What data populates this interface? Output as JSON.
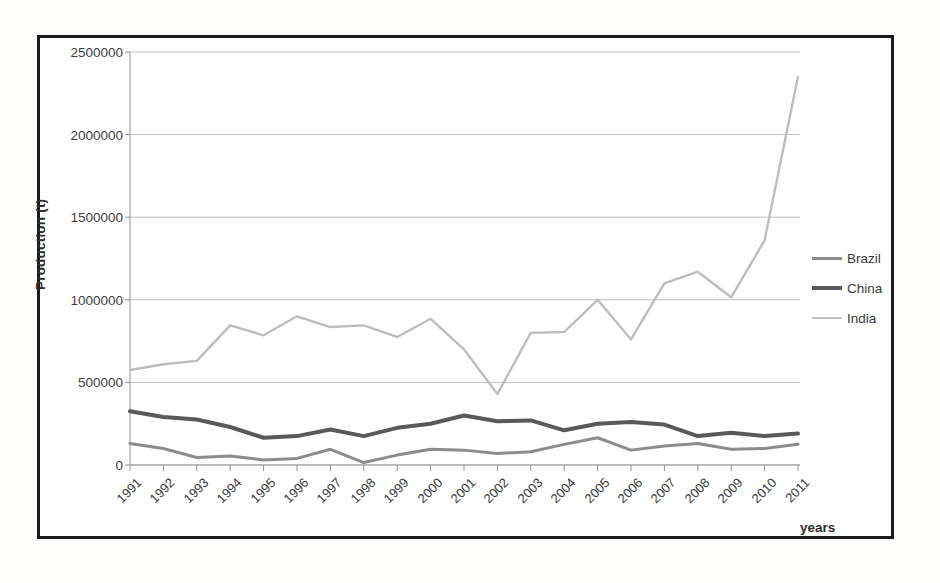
{
  "chart_data": {
    "type": "line",
    "title": "",
    "xlabel": "years",
    "ylabel": "Production (t)",
    "x": [
      1991,
      1992,
      1993,
      1994,
      1995,
      1996,
      1997,
      1998,
      1999,
      2000,
      2001,
      2002,
      2003,
      2004,
      2005,
      2006,
      2007,
      2008,
      2009,
      2010,
      2011
    ],
    "categories": [
      "1991",
      "1992",
      "1993",
      "1994",
      "1995",
      "1996",
      "1997",
      "1998",
      "1999",
      "2000",
      "2001",
      "2002",
      "2003",
      "2004",
      "2005",
      "2006",
      "2007",
      "2008",
      "2009",
      "2010",
      "2011"
    ],
    "ylim": [
      0,
      2500000
    ],
    "xlim": [
      1991,
      2011
    ],
    "yticks": [
      0,
      500000,
      1000000,
      1500000,
      2000000,
      2500000
    ],
    "ytick_labels": [
      "0",
      "500000",
      "1000000",
      "1500000",
      "2000000",
      "2500000"
    ],
    "grid": "horizontal",
    "legend_position": "right",
    "series": [
      {
        "name": "Brazil",
        "color": "#8c8c8c",
        "width": 3,
        "values": [
          130000,
          100000,
          45000,
          55000,
          30000,
          40000,
          95000,
          15000,
          60000,
          95000,
          90000,
          70000,
          80000,
          125000,
          165000,
          90000,
          115000,
          130000,
          95000,
          100000,
          125000
        ]
      },
      {
        "name": "China",
        "color": "#595959",
        "width": 4,
        "values": [
          325000,
          290000,
          275000,
          230000,
          165000,
          175000,
          215000,
          175000,
          225000,
          250000,
          300000,
          265000,
          270000,
          210000,
          250000,
          260000,
          245000,
          175000,
          195000,
          175000,
          190000
        ]
      },
      {
        "name": "India",
        "color": "#bdbdbd",
        "width": 2.4,
        "values": [
          575000,
          610000,
          630000,
          845000,
          785000,
          900000,
          835000,
          845000,
          775000,
          885000,
          700000,
          430000,
          800000,
          805000,
          1000000,
          760000,
          1100000,
          1170000,
          1015000,
          1360000,
          2350000
        ]
      }
    ]
  },
  "legend": {
    "items": [
      {
        "label": "Brazil",
        "color": "#8c8c8c",
        "thickness": 3
      },
      {
        "label": "China",
        "color": "#595959",
        "thickness": 4.5
      },
      {
        "label": "India",
        "color": "#c2c2c2",
        "thickness": 2
      }
    ]
  },
  "axes": {
    "y_title": "Production (t)",
    "x_title": "years"
  }
}
